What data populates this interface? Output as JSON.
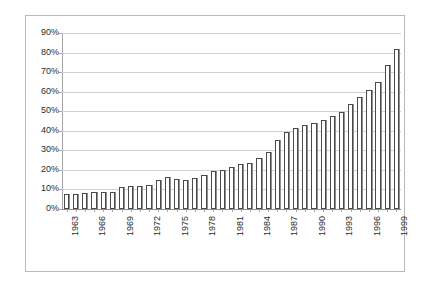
{
  "chart_data": {
    "type": "bar",
    "title": "",
    "subtitle": "",
    "xlabel": "",
    "ylabel": "",
    "ylim": [
      0,
      90
    ],
    "ytick_labels": [
      "0%",
      "10%",
      "20%",
      "30%",
      "40%",
      "50%",
      "60%",
      "70%",
      "80%",
      "90%"
    ],
    "ytick_values": [
      0,
      10,
      20,
      30,
      40,
      50,
      60,
      70,
      80,
      90
    ],
    "grid": true,
    "legend": "none",
    "xtick_label_interval": 3,
    "xtick_labels_shown": [
      "1963",
      "1966",
      "1969",
      "1972",
      "1975",
      "1978",
      "1981",
      "1984",
      "1987",
      "1990",
      "1993",
      "1996",
      "1999"
    ],
    "categories": [
      "1963",
      "1964",
      "1965",
      "1966",
      "1967",
      "1968",
      "1969",
      "1970",
      "1971",
      "1972",
      "1973",
      "1974",
      "1975",
      "1976",
      "1977",
      "1978",
      "1979",
      "1980",
      "1981",
      "1982",
      "1983",
      "1984",
      "1985",
      "1986",
      "1987",
      "1988",
      "1989",
      "1990",
      "1991",
      "1992",
      "1993",
      "1994",
      "1995",
      "1996",
      "1997",
      "1998",
      "1999"
    ],
    "values": [
      7.5,
      7.8,
      8.3,
      8.7,
      8.6,
      8.8,
      11.2,
      12.0,
      12.0,
      12.4,
      14.8,
      16.6,
      15.4,
      15.0,
      16.1,
      17.3,
      19.2,
      19.9,
      21.6,
      23.2,
      23.6,
      26.2,
      29.2,
      35.2,
      39.4,
      41.4,
      42.8,
      44.2,
      45.7,
      47.6,
      49.5,
      53.6,
      57.5,
      61.1,
      65.0,
      73.6,
      81.7
    ],
    "value_unit": "%",
    "colors": {
      "bar_fill": "#ffffff",
      "bar_stroke": "#4a4a4a",
      "bar_shadow": "#8e8e8e",
      "gridline": "#d2d2d2",
      "axis": "#a6a6a6",
      "frame": "#b9b9b9",
      "text": "#2b2b2b",
      "background": "#ffffff"
    }
  }
}
